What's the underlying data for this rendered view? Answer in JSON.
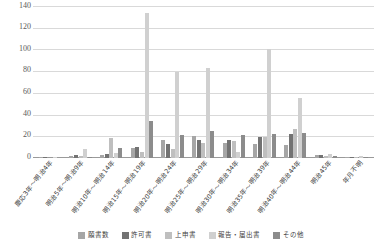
{
  "chart_data": {
    "type": "bar",
    "title": "",
    "xlabel": "",
    "ylabel": "",
    "ylim": [
      0,
      140
    ],
    "yticks": [
      140,
      120,
      100,
      80,
      60,
      40,
      20,
      0
    ],
    "grid": true,
    "legend_position": "bottom",
    "categories": [
      "慶応3年～明治4年",
      "明治5年～明治9年",
      "明治10年～明治14年",
      "明治15年～明治19年",
      "明治20年～明治24年",
      "明治25年～明治29年",
      "明治30年～明治34年",
      "明治35年～明治39年",
      "明治40年～明治44年",
      "明治45年",
      "年月不明"
    ],
    "series": [
      {
        "name": "願書数",
        "color": "#a6a6a6",
        "values": [
          1,
          2,
          3,
          9,
          17,
          20,
          14,
          13,
          12,
          3,
          1
        ]
      },
      {
        "name": "許可書",
        "color": "#737373",
        "values": [
          1,
          3,
          4,
          10,
          13,
          17,
          17,
          19,
          22,
          3,
          1
        ]
      },
      {
        "name": "上申書",
        "color": "#bfbfbf",
        "values": [
          0,
          2,
          18,
          6,
          8,
          14,
          16,
          19,
          27,
          2,
          1
        ]
      },
      {
        "name": "報告・届出書",
        "color": "#d0d0d0",
        "values": [
          1,
          8,
          5,
          134,
          79,
          83,
          6,
          100,
          55,
          4,
          2
        ]
      },
      {
        "name": "その他",
        "color": "#8c8c8c",
        "values": [
          0,
          1,
          9,
          34,
          21,
          25,
          21,
          22,
          23,
          2,
          1
        ]
      }
    ]
  }
}
